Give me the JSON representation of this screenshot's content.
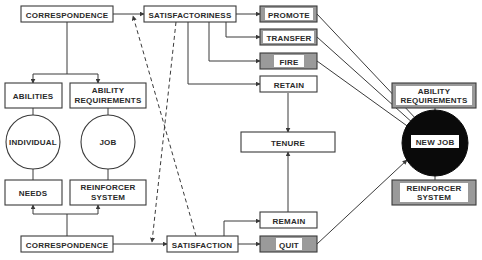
{
  "diagram": {
    "nodes": {
      "correspondence_top": "CORRESPONDENCE",
      "satisfactoriness": "SATISFACTORINESS",
      "promote": "PROMOTE",
      "transfer": "TRANSFER",
      "fire": "FIRE",
      "retain": "RETAIN",
      "abilities": "ABILITIES",
      "ability_requirements_left_1": "ABILITY",
      "ability_requirements_left_2": "REQUIREMENTS",
      "individual": "INDIVIDUAL",
      "job": "JOB",
      "needs": "NEEDS",
      "reinforcer_left_1": "REINFORCER",
      "reinforcer_left_2": "SYSTEM",
      "correspondence_bottom": "CORRESPONDENCE",
      "satisfaction": "SATISFACTION",
      "remain": "REMAIN",
      "quit": "QUIT",
      "tenure": "TENURE",
      "new_job": "NEW JOB",
      "ability_requirements_right_1": "ABILITY",
      "ability_requirements_right_2": "REQUIREMENTS",
      "reinforcer_right_1": "REINFORCER",
      "reinforcer_right_2": "SYSTEM"
    },
    "edges": [
      {
        "from": "correspondence_top",
        "to": "abilities"
      },
      {
        "from": "correspondence_top",
        "to": "ability_requirements_left"
      },
      {
        "from": "correspondence_top",
        "to": "satisfactoriness"
      },
      {
        "from": "satisfactoriness",
        "to": "promote"
      },
      {
        "from": "satisfactoriness",
        "to": "transfer"
      },
      {
        "from": "satisfactoriness",
        "to": "fire"
      },
      {
        "from": "satisfactoriness",
        "to": "retain"
      },
      {
        "from": "retain",
        "to": "tenure"
      },
      {
        "from": "correspondence_bottom",
        "to": "needs"
      },
      {
        "from": "correspondence_bottom",
        "to": "reinforcer_left"
      },
      {
        "from": "correspondence_bottom",
        "to": "satisfaction"
      },
      {
        "from": "satisfaction",
        "to": "remain"
      },
      {
        "from": "satisfaction",
        "to": "quit"
      },
      {
        "from": "remain",
        "to": "tenure"
      },
      {
        "from": "promote",
        "to": "new_job"
      },
      {
        "from": "transfer",
        "to": "new_job"
      },
      {
        "from": "fire",
        "to": "new_job"
      },
      {
        "from": "quit",
        "to": "new_job"
      },
      {
        "from": "satisfactoriness",
        "to": "satisfaction",
        "style": "dashed"
      },
      {
        "from": "satisfaction",
        "to": "satisfactoriness",
        "style": "dashed"
      }
    ],
    "colors": {
      "line": "#3a3a3a",
      "shaded_box": "#9a9a9a",
      "new_job_fill": "#0a0a0a",
      "background": "#ffffff"
    }
  }
}
